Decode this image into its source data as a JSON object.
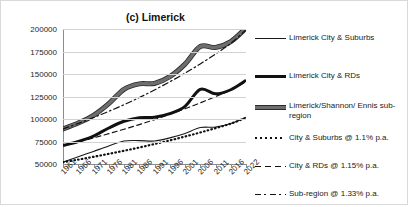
{
  "chart_data": {
    "type": "line",
    "title": "(c) Limerick",
    "xlabel": "",
    "ylabel": "",
    "grid": true,
    "legend_position": "right",
    "ylim": [
      50000,
      200000
    ],
    "yticks": [
      200000,
      175000,
      150000,
      125000,
      100000,
      75000,
      50000
    ],
    "ytick_labels": [
      "200000",
      "175000",
      "150000",
      "125000",
      "100000",
      "75000",
      "50000"
    ],
    "categories": [
      1961,
      1966,
      1971,
      1976,
      1981,
      1986,
      1991,
      1996,
      2001,
      2006,
      2011,
      2016,
      2022
    ],
    "xtick_labels": [
      "1961",
      "1966",
      "1971",
      "1976",
      "1981",
      "1986",
      "1991",
      "1996",
      "2001",
      "2006",
      "2011",
      "2016",
      "2022"
    ],
    "series": [
      {
        "name": "Limerick City & Suburbs",
        "style": "thin-solid",
        "color": "#1a1a1a",
        "values": [
          52000,
          58000,
          64000,
          70000,
          75500,
          76000,
          75500,
          79000,
          84000,
          90500,
          91000,
          95000,
          102000
        ]
      },
      {
        "name": "Limerick City & RDs",
        "style": "thick-solid",
        "color": "#111111",
        "values": [
          70500,
          75000,
          81000,
          90000,
          97500,
          101500,
          102000,
          106000,
          114000,
          133000,
          128000,
          132500,
          143000
        ]
      },
      {
        "name": "Limerick/Shannon/Ennis sub-region",
        "style": "grey-thick-solid",
        "color": "#6e6e6e",
        "values": [
          89000,
          95500,
          104000,
          117000,
          133000,
          139000,
          139500,
          147000,
          161000,
          180500,
          179500,
          186000,
          201000
        ]
      },
      {
        "name": "City & Suburbs @ 1.1% p.a.",
        "style": "dotted",
        "color": "#111111",
        "values": [
          52000,
          54900,
          58000,
          61300,
          64700,
          68300,
          72200,
          76200,
          80500,
          85000,
          89800,
          94800,
          101300
        ]
      },
      {
        "name": "City & RDs @ 1.15% p.a.",
        "style": "dashed",
        "color": "#111111",
        "values": [
          70500,
          74600,
          79000,
          83700,
          88600,
          93800,
          99300,
          105200,
          111400,
          117900,
          124900,
          132200,
          141700
        ]
      },
      {
        "name": "Sub-region @ 1.33% p.a.",
        "style": "dash-dot",
        "color": "#111111",
        "values": [
          89000,
          95100,
          101600,
          108500,
          115900,
          123800,
          132300,
          141300,
          150900,
          161200,
          172200,
          184000,
          199200
        ]
      }
    ]
  },
  "legend": {
    "items": [
      {
        "label": "Limerick City & Suburbs",
        "key": "thin-solid"
      },
      {
        "label": "Limerick City & RDs",
        "key": "thick-solid"
      },
      {
        "label": "Limerick/Shannon/ Ennis sub-region",
        "key": "grey-thick-solid"
      },
      {
        "label": "City & Suburbs @ 1.1% p.a.",
        "key": "dotted"
      },
      {
        "label": "City & RDs @ 1.15% p.a.",
        "key": "dashed"
      },
      {
        "label": "Sub-region @ 1.33% p.a.",
        "key": "dash-dot"
      }
    ]
  }
}
